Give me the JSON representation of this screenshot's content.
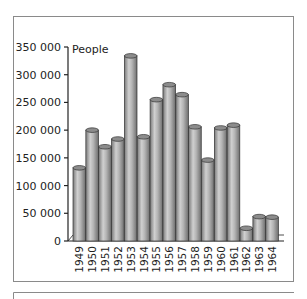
{
  "chart_data": {
    "type": "bar",
    "title": "",
    "xlabel": "",
    "ylabel": "People",
    "ylim": [
      0,
      350000
    ],
    "yticks": [
      0,
      50000,
      100000,
      150000,
      200000,
      250000,
      300000,
      350000
    ],
    "ytick_labels": [
      "0",
      "50 000",
      "100 000",
      "150 000",
      "200 000",
      "250 000",
      "300 000",
      "350 000"
    ],
    "categories": [
      "1949",
      "1950",
      "1951",
      "1952",
      "1953",
      "1954",
      "1955",
      "1956",
      "1957",
      "1958",
      "1959",
      "1960",
      "1961",
      "1962",
      "1963",
      "1964"
    ],
    "values": [
      132000,
      200000,
      170000,
      184000,
      334000,
      188000,
      255000,
      282000,
      264000,
      206000,
      146000,
      204000,
      209000,
      23000,
      44000,
      43000
    ],
    "style": "3d-cylinder",
    "bar_color": "#a8a8a8",
    "grid": false,
    "legend": false
  }
}
